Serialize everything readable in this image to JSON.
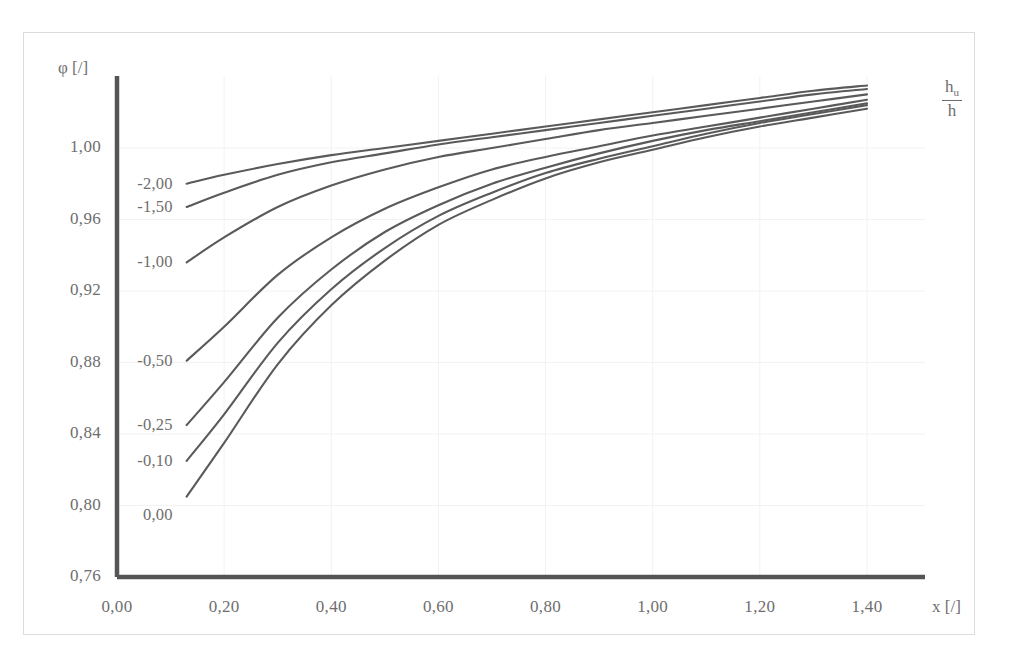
{
  "axes": {
    "y_title": "φ [/]",
    "x_title": "x [/]",
    "series_title_numerator": "h",
    "series_title_numerator_sub": "u",
    "series_title_denominator": "h",
    "y_ticks": [
      "1,00",
      "0,96",
      "0,92",
      "0,88",
      "0,84",
      "0,80",
      "0,76"
    ],
    "x_ticks": [
      "0,00",
      "0,20",
      "0,40",
      "0,60",
      "0,80",
      "1,00",
      "1,20",
      "1,40"
    ],
    "axis_color": "#555555",
    "grid_color": "#f2f2f2",
    "curve_color": "#5a5a5a",
    "text_color": "#6e6e6e"
  },
  "curve_labels": [
    "-2,00",
    "-1,50",
    "-1,00",
    "-0,50",
    "-0,25",
    "-0,10",
    "0,00"
  ],
  "chart_data": {
    "type": "line",
    "title": "",
    "subtitle": "",
    "xlabel": "x [/]",
    "ylabel": "φ [/]",
    "xlim": [
      0.0,
      1.4
    ],
    "ylim": [
      0.76,
      1.0
    ],
    "y_ticks": [
      1.0,
      0.96,
      0.92,
      0.88,
      0.84,
      0.8,
      0.76
    ],
    "x_ticks": [
      0.0,
      0.2,
      0.4,
      0.6,
      0.8,
      1.0,
      1.2,
      1.4
    ],
    "grid": true,
    "legend": "inline-curve-labels",
    "legend_position": "left-inside-plot",
    "annotations": [
      {
        "text": "h_u / h",
        "position": "top-right",
        "role": "series-parameter-name"
      }
    ],
    "series_parameter": "h_u/h",
    "x": [
      0.13,
      0.2,
      0.3,
      0.4,
      0.5,
      0.6,
      0.7,
      0.8,
      0.9,
      1.0,
      1.1,
      1.2,
      1.3,
      1.4
    ],
    "series": [
      {
        "name": "-2,00",
        "values": [
          0.98,
          0.985,
          0.991,
          0.996,
          1.0,
          1.004,
          1.008,
          1.012,
          1.016,
          1.02,
          1.024,
          1.028,
          1.032,
          1.035
        ]
      },
      {
        "name": "-1,50",
        "values": [
          0.967,
          0.975,
          0.985,
          0.992,
          0.997,
          1.002,
          1.006,
          1.01,
          1.014,
          1.018,
          1.022,
          1.026,
          1.03,
          1.033
        ]
      },
      {
        "name": "-1,00",
        "values": [
          0.936,
          0.95,
          0.967,
          0.979,
          0.988,
          0.995,
          1.0,
          1.005,
          1.01,
          1.014,
          1.018,
          1.022,
          1.026,
          1.03
        ]
      },
      {
        "name": "-0,50",
        "values": [
          0.881,
          0.9,
          0.929,
          0.95,
          0.966,
          0.978,
          0.988,
          0.995,
          1.001,
          1.007,
          1.012,
          1.017,
          1.022,
          1.027
        ]
      },
      {
        "name": "-0,25",
        "values": [
          0.845,
          0.869,
          0.905,
          0.932,
          0.953,
          0.968,
          0.98,
          0.989,
          0.997,
          1.004,
          1.01,
          1.015,
          1.02,
          1.025
        ]
      },
      {
        "name": "-0,10",
        "values": [
          0.825,
          0.851,
          0.891,
          0.921,
          0.944,
          0.962,
          0.975,
          0.986,
          0.994,
          1.001,
          1.008,
          1.014,
          1.019,
          1.024
        ]
      },
      {
        "name": "0,00",
        "values": [
          0.805,
          0.835,
          0.879,
          0.912,
          0.937,
          0.957,
          0.971,
          0.983,
          0.992,
          0.999,
          1.006,
          1.012,
          1.017,
          1.022
        ]
      }
    ]
  }
}
